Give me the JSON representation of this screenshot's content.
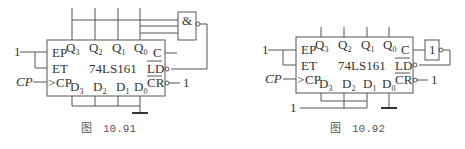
{
  "figures": [
    {
      "id": "fig1",
      "caption_prefix": "图",
      "caption_number": "10.91",
      "chip": {
        "name": "74LS161",
        "pins_left": [
          "EP",
          "ET",
          "CP"
        ],
        "pins_top": [
          "Q",
          "Q",
          "Q",
          "Q"
        ],
        "pins_top_sub": [
          "3",
          "2",
          "1",
          "0"
        ],
        "pins_bottom": [
          "D",
          "D",
          "D",
          "D"
        ],
        "pins_bottom_sub": [
          "3",
          "2",
          "1",
          "0"
        ],
        "pins_right": [
          "C",
          "LD",
          "CR"
        ]
      },
      "inputs": {
        "ep_et": "1",
        "clock": "CP",
        "cr": "1"
      },
      "gate": {
        "type": "NAND",
        "symbol": "&"
      },
      "data_inputs": "all grounded"
    },
    {
      "id": "fig2",
      "caption_prefix": "图",
      "caption_number": "10.92",
      "chip": {
        "name": "74LS161",
        "pins_left": [
          "EP",
          "ET",
          "CP"
        ],
        "pins_top": [
          "Q",
          "Q",
          "Q",
          "Q"
        ],
        "pins_top_sub": [
          "3",
          "2",
          "1",
          "0"
        ],
        "pins_bottom": [
          "D",
          "D",
          "D",
          "D"
        ],
        "pins_bottom_sub": [
          "3",
          "2",
          "1",
          "0"
        ],
        "pins_right": [
          "C",
          "LD",
          "CR"
        ]
      },
      "inputs": {
        "ep_et": "1",
        "clock": "CP",
        "cr": "1",
        "data_high": "1"
      },
      "gate": {
        "type": "NOT",
        "symbol": "1"
      },
      "data_inputs": "D3,D2,D1 = 1; D0 grounded"
    }
  ]
}
